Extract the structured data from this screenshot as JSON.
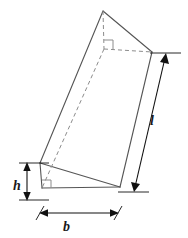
{
  "figure": {
    "shape_name": "triangular-prism",
    "colors": {
      "solid_edge": "#555555",
      "hidden_edge": "#8c8c8c",
      "dimension_line": "#111111",
      "label_text": "#1a1a1a",
      "background": "#ffffff"
    },
    "labels": {
      "height": "h",
      "base": "b",
      "length": "l"
    },
    "annotations": {
      "right_angle_front": "right-angle-marker",
      "right_angle_back": "right-angle-marker"
    },
    "dimensions": {
      "height_label": "h",
      "base_label": "b",
      "length_label": "l"
    }
  }
}
